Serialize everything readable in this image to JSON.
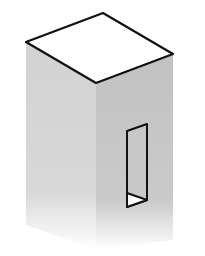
{
  "figure": {
    "colors": {
      "background": "#ffffff",
      "top_face": "#ffffff",
      "left_face": "#d6d6d6",
      "right_face": "#c4c4c4",
      "outline": "#111111",
      "window_sill": "#ffffff"
    }
  }
}
